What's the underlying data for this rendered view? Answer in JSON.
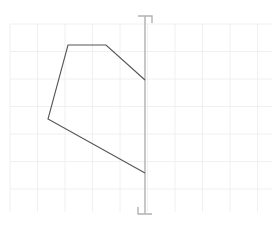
{
  "canvas": {
    "width": 279,
    "height": 231,
    "background_color": "#ffffff"
  },
  "grid": {
    "name": "grid",
    "visible": true,
    "x_start": 10,
    "y_start": 24,
    "x_end": 272,
    "y_end": 212,
    "cell_size": 27.5,
    "line_color": "#ececf0",
    "line_width": 0.8
  },
  "guide_line": {
    "name": "vertical-guide-line",
    "orientation": "vertical",
    "x": 145,
    "y_top": 16,
    "y_bottom": 214,
    "color": "#b9b9bd",
    "line_width": 1.6
  },
  "markers": [
    {
      "name": "top-corner-bracket",
      "type": "corner-bracket",
      "corner": "top-right",
      "x": 145,
      "y": 16,
      "arm_length": 7,
      "color": "#b2b2b6",
      "line_width": 1.4
    },
    {
      "name": "bottom-corner-bracket",
      "type": "corner-bracket",
      "corner": "bottom-left",
      "x": 145,
      "y": 214,
      "arm_length": 7,
      "color": "#b2b2b6",
      "line_width": 1.4
    }
  ],
  "shape": {
    "name": "polygon-outline",
    "type": "polyline",
    "closed": false,
    "stroke_color": "#555558",
    "stroke_width": 1.1,
    "fill": "none",
    "points": [
      [
        145,
        80
      ],
      [
        106,
        45
      ],
      [
        68,
        45
      ],
      [
        48,
        119
      ],
      [
        145,
        173
      ]
    ]
  }
}
